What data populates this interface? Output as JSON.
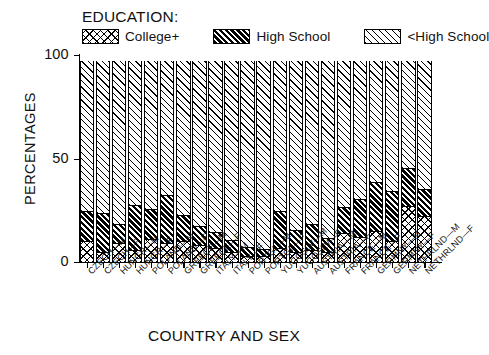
{
  "chart_data": {
    "type": "bar",
    "subtype": "stacked-bar-100",
    "title": "",
    "legend_title": "EDUCATION:",
    "legend_position": "top",
    "grid": false,
    "xlabel": "COUNTRY AND SEX",
    "ylabel": "PERCENTAGES",
    "ylim": [
      0,
      100
    ],
    "yticks": [
      0,
      50,
      100
    ],
    "ytick_labels": [
      "0",
      "50",
      "100"
    ],
    "categories": [
      "CZECH—M",
      "CZECH—F",
      "HUNGR—M",
      "HUNGR—F",
      "POLAND—M",
      "POLAND—F",
      "GREECE—M",
      "GREECE—F",
      "ITALY—M",
      "ITALY—F",
      "PORTGL—M",
      "PORTGL—F",
      "YUGOSLV—M",
      "YUGOSLV—F",
      "AUSTRIA—M",
      "AUSTRIA—F",
      "FRANCE—M",
      "FRANCE—F",
      "GERMNY—M",
      "GERMNY—F",
      "NETHRLND—M",
      "NETHRLND—F"
    ],
    "series": [
      {
        "name": "College+",
        "pattern": "cross-hatch",
        "values": [
          10,
          5,
          9,
          6,
          11,
          9,
          10,
          8,
          7,
          5,
          3,
          3,
          7,
          5,
          6,
          5,
          14,
          12,
          15,
          10,
          27,
          22
        ]
      },
      {
        "name": "High School",
        "pattern": "dense-dark-diagonal",
        "values": [
          14,
          18,
          9,
          21,
          14,
          23,
          12,
          9,
          7,
          5,
          4,
          3,
          17,
          10,
          12,
          6,
          12,
          18,
          23,
          24,
          18,
          13
        ]
      },
      {
        "name": "<High School",
        "pattern": "sparse-light-diagonal",
        "values": [
          73,
          74,
          79,
          70,
          72,
          65,
          75,
          80,
          83,
          87,
          90,
          91,
          73,
          82,
          79,
          86,
          71,
          67,
          59,
          63,
          52,
          62
        ]
      }
    ],
    "bar_total": 97
  }
}
